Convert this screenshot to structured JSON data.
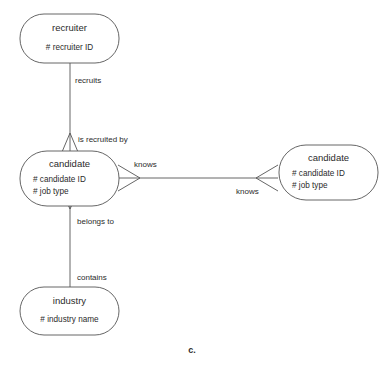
{
  "diagram": {
    "caption": "c.",
    "stroke_color": "#555555",
    "text_color": "#2b2b2b",
    "background_color": "#ffffff",
    "entities": [
      {
        "id": "recruiter",
        "title": "recruiter",
        "attributes": [
          "# recruiter ID"
        ]
      },
      {
        "id": "candidate_left",
        "title": "candidate",
        "attributes": [
          "# candidate ID",
          "# job type"
        ]
      },
      {
        "id": "candidate_right",
        "title": "candidate",
        "attributes": [
          "# candidate ID",
          "# job type"
        ]
      },
      {
        "id": "industry",
        "title": "industry",
        "attributes": [
          "# industry name"
        ]
      }
    ],
    "relationships": [
      {
        "id": "recruits",
        "label": "recruits"
      },
      {
        "id": "is_recruited_by",
        "label": "is recruited by"
      },
      {
        "id": "knows_left",
        "label": "knows"
      },
      {
        "id": "knows_right",
        "label": "knows"
      },
      {
        "id": "belongs_to",
        "label": "belongs to"
      },
      {
        "id": "contains",
        "label": "contains"
      }
    ]
  }
}
